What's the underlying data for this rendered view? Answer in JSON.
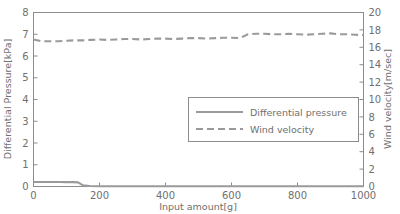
{
  "chart_data": {
    "type": "line",
    "title": "",
    "xlabel": "Input amount[g]",
    "ylabel": "Differential Pressure[kPa]",
    "y2label": "Wind velocity[m/sec]",
    "xlim": [
      0,
      1000
    ],
    "ylim": [
      0,
      8
    ],
    "y2lim": [
      0,
      20
    ],
    "xticks": [
      0,
      200,
      400,
      600,
      800,
      1000
    ],
    "xticklabels": [
      "0",
      "200",
      "400",
      "600",
      "800",
      "1000"
    ],
    "yticks": [
      0,
      1,
      2,
      3,
      4,
      5,
      6,
      7,
      8
    ],
    "yticklabels": [
      "0",
      "1",
      "2",
      "3",
      "4",
      "5",
      "6",
      "7",
      "8"
    ],
    "y2ticks": [
      0,
      2,
      4,
      6,
      8,
      10,
      12,
      14,
      16,
      18,
      20
    ],
    "y2ticklabels": [
      "0",
      "2",
      "4",
      "6",
      "8",
      "10",
      "12",
      "14",
      "16",
      "18",
      "20"
    ],
    "grid": false,
    "legend_position": "center-right",
    "series": [
      {
        "name": "Differential pressure",
        "axis": "left",
        "style": "solid",
        "color": "#9a9a9a",
        "x": [
          0,
          20,
          40,
          60,
          80,
          100,
          120,
          135,
          150,
          170,
          200,
          300,
          400,
          500,
          600,
          700,
          800,
          900,
          1000
        ],
        "values": [
          0.21,
          0.21,
          0.21,
          0.21,
          0.21,
          0.2,
          0.2,
          0.19,
          0.05,
          0.02,
          0.01,
          0.01,
          0.01,
          0.01,
          0.01,
          0.01,
          0.01,
          0.01,
          0.01
        ]
      },
      {
        "name": "Wind velocity",
        "axis": "right",
        "style": "dashed",
        "color": "#9a9a9a",
        "x": [
          0,
          25,
          50,
          75,
          100,
          125,
          150,
          175,
          200,
          225,
          250,
          275,
          300,
          325,
          350,
          375,
          400,
          425,
          450,
          475,
          500,
          525,
          550,
          575,
          600,
          625,
          650,
          675,
          700,
          725,
          750,
          775,
          800,
          825,
          850,
          875,
          900,
          925,
          950,
          975,
          1000
        ],
        "values": [
          16.9,
          16.7,
          16.7,
          16.7,
          16.75,
          16.8,
          16.8,
          16.85,
          16.9,
          16.85,
          16.9,
          16.95,
          16.95,
          16.9,
          16.95,
          17.0,
          17.0,
          16.95,
          17.0,
          17.05,
          17.05,
          17.0,
          17.05,
          17.1,
          17.1,
          17.05,
          17.5,
          17.55,
          17.55,
          17.5,
          17.5,
          17.55,
          17.5,
          17.45,
          17.5,
          17.55,
          17.6,
          17.5,
          17.5,
          17.45,
          17.4
        ]
      }
    ],
    "legend": [
      {
        "label": "Differential pressure",
        "style": "solid"
      },
      {
        "label": "Wind velocity",
        "style": "dashed"
      }
    ]
  },
  "colors": {
    "series": "#9a9a9a",
    "axis": "#8c8c8c",
    "text": "#6f6f6f",
    "background": "#ffffff"
  }
}
